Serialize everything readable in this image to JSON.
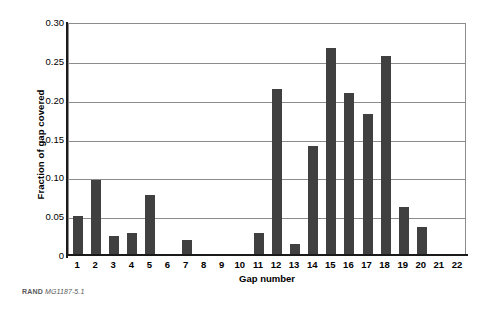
{
  "chart_data": {
    "type": "bar",
    "title": "",
    "xlabel": "Gap number",
    "ylabel": "Fraction of gap covered",
    "categories": [
      "1",
      "2",
      "3",
      "4",
      "5",
      "6",
      "7",
      "8",
      "9",
      "10",
      "11",
      "12",
      "13",
      "14",
      "15",
      "16",
      "17",
      "18",
      "19",
      "20",
      "21",
      "22"
    ],
    "values": [
      0.05,
      0.096,
      0.025,
      0.028,
      0.077,
      0.0,
      0.019,
      0.0,
      0.0,
      0.0,
      0.028,
      0.214,
      0.014,
      0.14,
      0.266,
      0.209,
      0.182,
      0.256,
      0.062,
      0.036,
      0.0,
      0.0
    ],
    "ylim": [
      0,
      0.3
    ],
    "yticks": [
      0,
      0.05,
      0.1,
      0.15,
      0.2,
      0.25,
      0.3
    ],
    "ytick_labels": [
      "0",
      "0.05",
      "0.10",
      "0.15",
      "0.20",
      "0.25",
      "0.30"
    ],
    "grid": true,
    "legend": false,
    "bar_color": "#404040",
    "grid_color": "#8c8c8c",
    "axis_color": "#1a1a1a"
  },
  "footer": {
    "brand": "RAND",
    "document_id": "MG1187-5.1"
  }
}
